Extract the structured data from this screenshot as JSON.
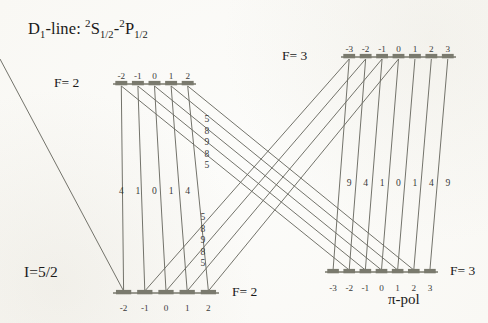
{
  "figure": {
    "title_prefix": "D",
    "title_sub": "1",
    "title_mid": "-line: ",
    "term_lower_sup": "2",
    "term_lower_base": "S",
    "term_lower_sub": "1/2",
    "term_dash": "-",
    "term_upper_sup": "2",
    "term_upper_base": "P",
    "term_upper_sub": "1/2",
    "nuclear_spin_label": "I=5/2",
    "polarization_label": "π-pol",
    "line_color": "#6b6b63",
    "bar_color": "#7a7a6e",
    "text_color": "#1a1a1a",
    "background": "#fdfdfb"
  },
  "levels": [
    {
      "id": "upper-left",
      "f_label": "F= 2",
      "f_value": 2,
      "label_side": "left",
      "label_x": 84,
      "label_y": 84,
      "bar_x1": 113,
      "bar_x2": 196,
      "bar_y": 84,
      "m_label_y": 72,
      "m_values": [
        "-2",
        "-1",
        "0",
        "1",
        "2"
      ]
    },
    {
      "id": "upper-right",
      "f_label": "F= 3",
      "f_value": 3,
      "label_side": "left",
      "label_x": 312,
      "label_y": 57,
      "bar_x1": 341,
      "bar_x2": 456,
      "bar_y": 57,
      "m_label_y": 45,
      "m_values": [
        "-3",
        "-2",
        "-1",
        "0",
        "1",
        "2",
        "3"
      ]
    },
    {
      "id": "lower-left",
      "f_label": "F= 2",
      "f_value": 2,
      "label_side": "right",
      "label_x": 228,
      "label_y": 293,
      "bar_x1": 113,
      "bar_x2": 219,
      "bar_y": 293,
      "m_label_y": 304,
      "m_values": [
        "-2",
        "-1",
        "0",
        "1",
        "2"
      ]
    },
    {
      "id": "lower-right",
      "f_label": "F= 3",
      "f_value": 3,
      "label_side": "right",
      "label_x": 446,
      "label_y": 272,
      "bar_x1": 325,
      "bar_x2": 438,
      "bar_y": 272,
      "m_label_y": 284,
      "m_values": [
        "-3",
        "-2",
        "-1",
        "0",
        "1",
        "2",
        "3"
      ]
    }
  ],
  "transition_groups": [
    {
      "id": "left-vertical",
      "from": "upper-left",
      "to": "lower-left",
      "description": "F=2 upper to F=2 lower, vertical pi transitions",
      "strengths": [
        "4",
        "1",
        "0",
        "1",
        "4"
      ],
      "strength_label_y": 186
    },
    {
      "id": "right-vertical",
      "from": "upper-right",
      "to": "lower-right",
      "description": "F=3 upper to F=3 lower, vertical pi transitions",
      "strengths": [
        "9",
        "4",
        "1",
        "0",
        "1",
        "4",
        "9"
      ],
      "strength_label_y": 178
    },
    {
      "id": "upper-cross",
      "from": "upper-left",
      "to": "lower-right",
      "description": "F=2 upper to F=3 lower, diagonal pi transitions",
      "strengths": [
        "5",
        "8",
        "9",
        "8",
        "5"
      ],
      "label_x": 207,
      "label_y_start": 114,
      "label_y_step": 11.5
    },
    {
      "id": "lower-cross",
      "from": "upper-right",
      "to": "lower-left",
      "description": "F=3 upper to F=2 lower, diagonal pi transitions",
      "strengths": [
        "5",
        "8",
        "9",
        "8",
        "5"
      ],
      "label_x": 203,
      "label_y_start": 212,
      "label_y_step": 11.5
    }
  ]
}
